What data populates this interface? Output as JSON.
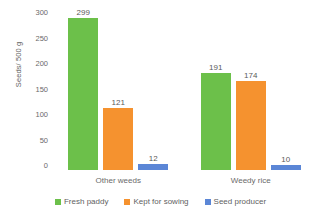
{
  "chart_data": {
    "type": "bar",
    "title": "",
    "xlabel": "",
    "ylabel": "Seeds/ 500 g",
    "ylim": [
      0,
      300
    ],
    "ytick_step": 50,
    "yticks": [
      "300",
      "250",
      "200",
      "150",
      "100",
      "50",
      "0"
    ],
    "grid": false,
    "legend_position": "bottom",
    "categories": [
      "Other weeds",
      "Weedy rice"
    ],
    "series": [
      {
        "name": "Fresh paddy",
        "color": "#6CC04A",
        "values": [
          299,
          191
        ],
        "labels": [
          "299",
          "191"
        ]
      },
      {
        "name": "Kept for sowing",
        "color": "#F5922F",
        "values": [
          121,
          174
        ],
        "labels": [
          "121",
          "174"
        ]
      },
      {
        "name": "Seed producer",
        "color": "#5B86D6",
        "values": [
          12,
          10
        ],
        "labels": [
          "12",
          "10"
        ]
      }
    ]
  },
  "legend": {
    "items": [
      {
        "label": "Fresh paddy",
        "color": "#6CC04A"
      },
      {
        "label": "Kept for sowing",
        "color": "#F5922F"
      },
      {
        "label": "Seed producer",
        "color": "#5B86D6"
      }
    ]
  }
}
